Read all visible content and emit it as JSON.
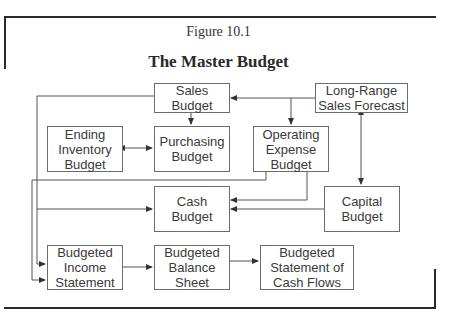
{
  "figure": {
    "label": "Figure 10.1",
    "title": "The Master Budget"
  },
  "boxes": {
    "sales_budget": "Sales\nBudget",
    "long_range_forecast": "Long-Range\nSales Forecast",
    "ending_inventory_budget": "Ending\nInventory\nBudget",
    "purchasing_budget": "Purchasing\nBudget",
    "operating_expense_budget": "Operating\nExpense\nBudget",
    "cash_budget": "Cash\nBudget",
    "capital_budget": "Capital\nBudget",
    "budgeted_income_statement": "Budgeted\nIncome\nStatement",
    "budgeted_balance_sheet": "Budgeted\nBalance\nSheet",
    "budgeted_cash_flows": "Budgeted\nStatement of\nCash Flows"
  },
  "edges": [
    {
      "from": "Long-Range Sales Forecast",
      "to": "Sales Budget"
    },
    {
      "from": "Long-Range Sales Forecast",
      "to": "Operating Expense Budget"
    },
    {
      "from": "Long-Range Sales Forecast",
      "to": "Capital Budget",
      "bidirectional": true
    },
    {
      "from": "Sales Budget",
      "to": "Purchasing Budget"
    },
    {
      "from": "Ending Inventory Budget",
      "to": "Purchasing Budget",
      "bidirectional": true
    },
    {
      "from": "Sales Budget",
      "to": "Cash Budget"
    },
    {
      "from": "Sales Budget",
      "to": "Budgeted Income Statement"
    },
    {
      "from": "Operating Expense Budget",
      "to": "Cash Budget"
    },
    {
      "from": "Operating Expense Budget",
      "to": "Budgeted Income Statement"
    },
    {
      "from": "Capital Budget",
      "to": "Cash Budget"
    },
    {
      "from": "Budgeted Income Statement",
      "to": "Budgeted Balance Sheet"
    },
    {
      "from": "Budgeted Balance Sheet",
      "to": "Budgeted Statement of Cash Flows"
    }
  ]
}
